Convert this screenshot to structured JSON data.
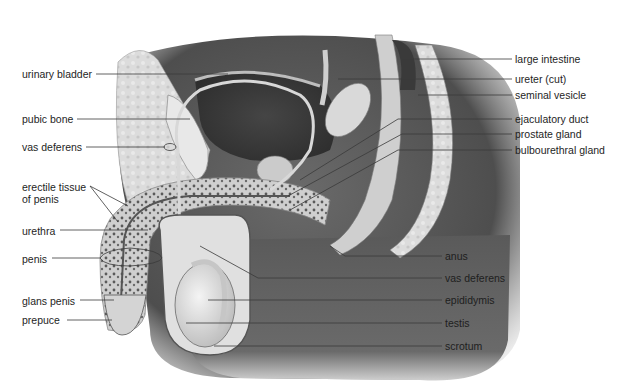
{
  "diagram": {
    "colors": {
      "background": "#ffffff",
      "label_text": "#1e1e1e",
      "leader_line": "#3a3a3a",
      "body_dark": "#4a4a4a",
      "body_mid": "#8a8a8a",
      "tissue_light": "#d6d6d6",
      "bladder_dark": "#3c3c3c"
    },
    "labels_left": [
      {
        "text": "urinary bladder",
        "x": 22,
        "y": 68,
        "line": [
          [
            96,
            74
          ],
          [
            228,
            74
          ]
        ]
      },
      {
        "text": "pubic bone",
        "x": 22,
        "y": 113,
        "line": [
          [
            77,
            119
          ],
          [
            190,
            119
          ]
        ]
      },
      {
        "text": "vas deferens",
        "x": 22,
        "y": 141,
        "line": [
          [
            86,
            147
          ],
          [
            165,
            147
          ]
        ],
        "loop": [
          170,
          147
        ]
      },
      {
        "text": "erectile tissue\nof penis",
        "x": 22,
        "y": 181,
        "line": [
          [
            90,
            186
          ],
          [
            128,
            206
          ]
        ],
        "line2": [
          [
            90,
            186
          ],
          [
            118,
            222
          ]
        ]
      },
      {
        "text": "urethra",
        "x": 22,
        "y": 225,
        "line": [
          [
            60,
            230
          ],
          [
            148,
            230
          ]
        ]
      },
      {
        "text": "penis",
        "x": 22,
        "y": 253,
        "line": [
          [
            52,
            258
          ],
          [
            100,
            258
          ]
        ],
        "bracket": true
      },
      {
        "text": "glans penis",
        "x": 22,
        "y": 295,
        "line": [
          [
            80,
            300
          ],
          [
            114,
            300
          ]
        ]
      },
      {
        "text": "prepuce",
        "x": 22,
        "y": 314,
        "line": [
          [
            67,
            320
          ],
          [
            112,
            320
          ]
        ]
      }
    ],
    "labels_right": [
      {
        "text": "large intestine",
        "x": 515,
        "y": 53,
        "line": [
          [
            402,
            59
          ],
          [
            512,
            59
          ]
        ]
      },
      {
        "text": "ureter (cut)",
        "x": 515,
        "y": 73,
        "line": [
          [
            338,
            79
          ],
          [
            512,
            79
          ]
        ]
      },
      {
        "text": "seminal vesicle",
        "x": 515,
        "y": 89,
        "line": [
          [
            418,
            95
          ],
          [
            512,
            95
          ]
        ]
      },
      {
        "text": "ejaculatory duct",
        "x": 515,
        "y": 113,
        "line": [
          [
            300,
            180
          ],
          [
            398,
            119
          ],
          [
            512,
            119
          ]
        ]
      },
      {
        "text": "prostate gland",
        "x": 515,
        "y": 128,
        "line": [
          [
            288,
            196
          ],
          [
            402,
            134
          ],
          [
            512,
            134
          ]
        ]
      },
      {
        "text": "bulbourethral gland",
        "x": 515,
        "y": 144,
        "line": [
          [
            290,
            210
          ],
          [
            398,
            150
          ],
          [
            512,
            150
          ]
        ]
      },
      {
        "text": "anus",
        "x": 445,
        "y": 250,
        "line": [
          [
            330,
            246
          ],
          [
            345,
            256
          ],
          [
            442,
            256
          ]
        ]
      },
      {
        "text": "vas deferens",
        "x": 445,
        "y": 272,
        "line": [
          [
            200,
            246
          ],
          [
            258,
            278
          ],
          [
            442,
            278
          ]
        ]
      },
      {
        "text": "epididymis",
        "x": 445,
        "y": 294,
        "line": [
          [
            208,
            300
          ],
          [
            442,
            300
          ]
        ]
      },
      {
        "text": "testis",
        "x": 445,
        "y": 317,
        "line": [
          [
            186,
            323
          ],
          [
            442,
            323
          ]
        ]
      },
      {
        "text": "scrotum",
        "x": 445,
        "y": 340,
        "line": [
          [
            214,
            346
          ],
          [
            442,
            346
          ]
        ]
      }
    ]
  }
}
